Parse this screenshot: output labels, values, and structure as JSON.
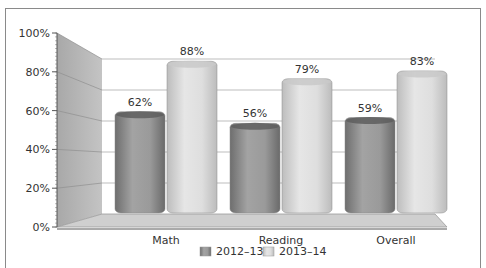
{
  "chart_data": {
    "type": "bar",
    "style": "3d-cylinder",
    "categories": [
      "Math",
      "Reading",
      "Overall"
    ],
    "series": [
      {
        "name": "2012–13",
        "values": [
          62,
          56,
          59
        ],
        "color": "#8c8c8c"
      },
      {
        "name": "2013–14",
        "values": [
          88,
          79,
          83
        ],
        "color": "#d4d4d4"
      }
    ],
    "data_labels": [
      [
        "62%",
        "56%",
        "59%"
      ],
      [
        "88%",
        "79%",
        "83%"
      ]
    ],
    "title": "",
    "xlabel": "",
    "ylabel": "",
    "yticks": [
      "0%",
      "20%",
      "40%",
      "60%",
      "80%",
      "100%"
    ],
    "ylim": [
      0,
      100
    ],
    "grid": true,
    "legend_position": "bottom"
  },
  "legend": {
    "items": [
      {
        "label": "2012–13"
      },
      {
        "label": "2013–14"
      }
    ]
  }
}
